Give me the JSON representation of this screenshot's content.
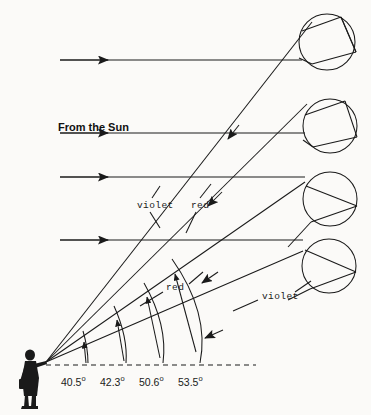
{
  "figure": {
    "background_color": "#fbfaf8",
    "ink_color": "#1a1a1a"
  },
  "sun_label": {
    "text": "From the Sun"
  },
  "ray_labels": [
    {
      "id": "violet-upper",
      "text": "violet",
      "x": 137,
      "y": 206
    },
    {
      "id": "red-upper",
      "text": "red",
      "x": 191,
      "y": 206
    },
    {
      "id": "red-lower",
      "text": "red",
      "x": 166,
      "y": 288
    },
    {
      "id": "violet-lower",
      "text": "violet",
      "x": 262,
      "y": 297
    }
  ],
  "angles": [
    {
      "id": "angle-40-5",
      "value": "40.5",
      "unit": "o",
      "x": 61,
      "y": 378
    },
    {
      "id": "angle-42-3",
      "value": "42.3",
      "unit": "o",
      "x": 100,
      "y": 378
    },
    {
      "id": "angle-50-6",
      "value": "50.6",
      "unit": "o",
      "x": 139,
      "y": 378
    },
    {
      "id": "angle-53-5",
      "value": "53.5",
      "unit": "o",
      "x": 178,
      "y": 378
    }
  ],
  "observer": {
    "name": "observer-silhouette",
    "eye_x": 46,
    "eye_y": 362
  },
  "raindrops": [
    {
      "id": "raindrop-1",
      "cx": 327,
      "cy": 42,
      "r": 28
    },
    {
      "id": "raindrop-2",
      "cx": 330,
      "cy": 126,
      "r": 27
    },
    {
      "id": "raindrop-3",
      "cx": 330,
      "cy": 199,
      "r": 27
    },
    {
      "id": "raindrop-4",
      "cx": 329,
      "cy": 266,
      "r": 27
    }
  ],
  "sun_rays": [
    {
      "id": "sun-ray-1",
      "y": 60,
      "x1": 60,
      "x2": 300
    },
    {
      "id": "sun-ray-2",
      "y": 133,
      "x1": 60,
      "x2": 303
    },
    {
      "id": "sun-ray-3",
      "y": 177,
      "x1": 60,
      "x2": 303
    },
    {
      "id": "sun-ray-4",
      "y": 240,
      "x1": 60,
      "x2": 302
    }
  ],
  "horizon": {
    "id": "horizon-dashed-line",
    "y": 365,
    "x1": 46,
    "x2": 256
  },
  "arc_count": 4
}
